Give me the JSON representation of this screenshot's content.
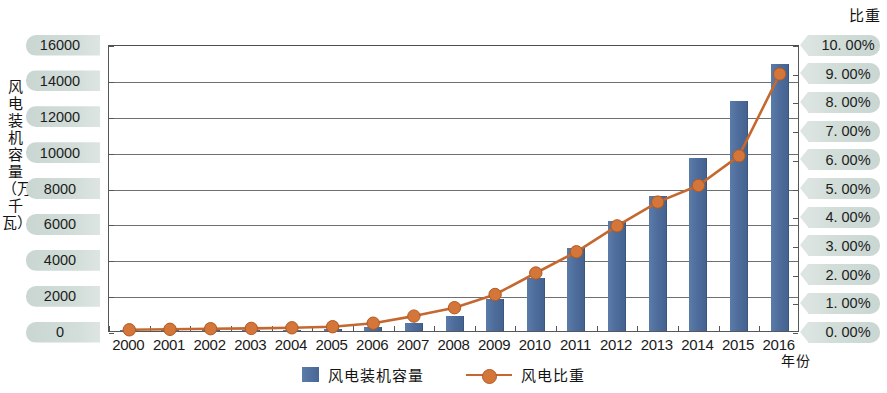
{
  "chart_data": {
    "type": "bar",
    "title": "",
    "xlabel": "年份",
    "ylabel": "风电装机容量（万千瓦）",
    "y2label": "比重",
    "categories": [
      "2000",
      "2001",
      "2002",
      "2003",
      "2004",
      "2005",
      "2006",
      "2007",
      "2008",
      "2009",
      "2010",
      "2011",
      "2012",
      "2013",
      "2014",
      "2015",
      "2016"
    ],
    "ylim": [
      0,
      16000
    ],
    "y2lim": [
      0,
      10
    ],
    "ytick_labels": [
      "16000",
      "14000",
      "12000",
      "10000",
      "8000",
      "6000",
      "4000",
      "2000",
      "0"
    ],
    "ytick_values": [
      16000,
      14000,
      12000,
      10000,
      8000,
      6000,
      4000,
      2000,
      0
    ],
    "y2tick_labels": [
      "10. 00%",
      "9. 00%",
      "8. 00%",
      "7. 00%",
      "6. 00%",
      "5. 00%",
      "4. 00%",
      "3. 00%",
      "2. 00%",
      "1. 00%",
      "0. 00%"
    ],
    "y2tick_values": [
      10,
      9,
      8,
      7,
      6,
      5,
      4,
      3,
      2,
      1,
      0
    ],
    "grid": true,
    "legend_position": "bottom-center",
    "series": [
      {
        "name": "风电装机容量",
        "type": "bar",
        "axis": "left",
        "unit": "万千瓦",
        "color": "#4e6d9c",
        "values": [
          35,
          40,
          47,
          57,
          76,
          106,
          207,
          420,
          839,
          1760,
          2958,
          4623,
          6142,
          7548,
          9657,
          12830,
          14864
        ]
      },
      {
        "name": "风电比重",
        "type": "line",
        "axis": "right",
        "unit": "%",
        "color": "#c4682f",
        "values": [
          0.11,
          0.13,
          0.15,
          0.16,
          0.18,
          0.22,
          0.34,
          0.59,
          0.88,
          1.34,
          2.09,
          2.83,
          3.73,
          4.56,
          5.14,
          6.17,
          9.02
        ]
      }
    ]
  },
  "axes": {
    "left_title": "风电装机容量（万千瓦）",
    "right_title": "比重",
    "bottom_title": "年份"
  },
  "legend": {
    "items": [
      {
        "label": "风电装机容量",
        "marker": "bar-swatch"
      },
      {
        "label": "风电比重",
        "marker": "line-marker"
      }
    ]
  },
  "colors": {
    "bar": "#4e6d9c",
    "line": "#c4682f",
    "marker": "#d4763a",
    "pill_bg": "#cfdad6",
    "axis": "#55585a"
  }
}
